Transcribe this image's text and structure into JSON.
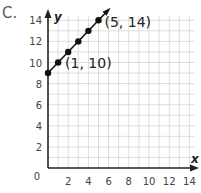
{
  "problem_label": "C.",
  "chart_data": {
    "type": "line",
    "title": "",
    "xlabel": "x",
    "ylabel": "y",
    "xlim": [
      0,
      14
    ],
    "ylim": [
      0,
      14
    ],
    "grid": true,
    "x_ticks": [
      2,
      4,
      6,
      8,
      10,
      12,
      14
    ],
    "y_ticks": [
      2,
      4,
      6,
      8,
      10,
      12,
      14
    ],
    "origin_label": "0",
    "series": [
      {
        "name": "y = x + 9",
        "points": [
          [
            0,
            9
          ],
          [
            1,
            10
          ],
          [
            2,
            11
          ],
          [
            3,
            12
          ],
          [
            4,
            13
          ],
          [
            5,
            14
          ]
        ],
        "extends_with_arrow": true
      }
    ],
    "annotations": [
      {
        "text": "(1, 10)",
        "x": 1,
        "y": 10
      },
      {
        "text": "(5, 14)",
        "x": 5,
        "y": 14
      }
    ]
  }
}
